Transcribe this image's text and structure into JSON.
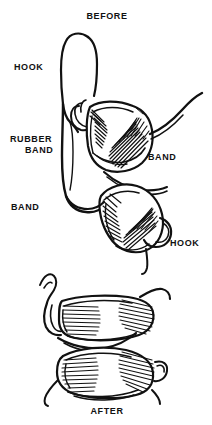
{
  "figure": {
    "type": "line-art-illustration",
    "background_color": "#ffffff",
    "ink_color": "#111111",
    "width": 212,
    "height": 425
  },
  "titles": {
    "top": "BEFORE",
    "bottom": "AFTER"
  },
  "labels": [
    {
      "id": "hook-upper-left",
      "text": "HOOK",
      "x": 14,
      "y": 66
    },
    {
      "id": "rubber-band-left",
      "line1": "RUBBER",
      "line2": "BAND",
      "x": 10,
      "y": 138
    },
    {
      "id": "band-right",
      "text": "BAND",
      "x": 148,
      "y": 155
    },
    {
      "id": "band-lower-left",
      "text": "BAND",
      "x": 11,
      "y": 204
    },
    {
      "id": "hook-lower-right",
      "text": "HOOK",
      "x": 170,
      "y": 240
    }
  ],
  "panels": [
    {
      "id": "before-panel",
      "title": "BEFORE",
      "description": "Upper and lower tooth separated, stretched rubber band spanning between hooks",
      "callouts": [
        "HOOK",
        "RUBBER BAND",
        "BAND",
        "BAND",
        "HOOK"
      ]
    },
    {
      "id": "after-panel",
      "title": "AFTER",
      "description": "Upper and lower tooth brought together in occlusion by the elastic",
      "callouts": []
    }
  ]
}
